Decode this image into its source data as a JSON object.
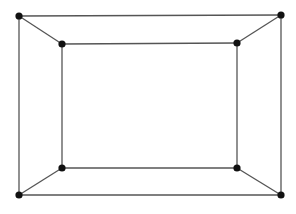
{
  "diagram": {
    "type": "graph",
    "colors": {
      "edge": "#555555",
      "node": "#111111",
      "background": "#ffffff"
    },
    "nodes": [
      {
        "id": "outer-top-left"
      },
      {
        "id": "outer-top-right"
      },
      {
        "id": "outer-bottom-right"
      },
      {
        "id": "outer-bottom-left"
      },
      {
        "id": "inner-top-left"
      },
      {
        "id": "inner-top-right"
      },
      {
        "id": "inner-bottom-right"
      },
      {
        "id": "inner-bottom-left"
      }
    ],
    "edges": [
      [
        "outer-top-left",
        "outer-top-right"
      ],
      [
        "outer-top-right",
        "outer-bottom-right"
      ],
      [
        "outer-bottom-right",
        "outer-bottom-left"
      ],
      [
        "outer-bottom-left",
        "outer-top-left"
      ],
      [
        "inner-top-left",
        "inner-top-right"
      ],
      [
        "inner-top-right",
        "inner-bottom-right"
      ],
      [
        "inner-bottom-right",
        "inner-bottom-left"
      ],
      [
        "inner-bottom-left",
        "inner-top-left"
      ],
      [
        "outer-top-left",
        "inner-top-left"
      ],
      [
        "outer-top-right",
        "inner-top-right"
      ],
      [
        "outer-bottom-right",
        "inner-bottom-right"
      ],
      [
        "outer-bottom-left",
        "inner-bottom-left"
      ]
    ]
  }
}
